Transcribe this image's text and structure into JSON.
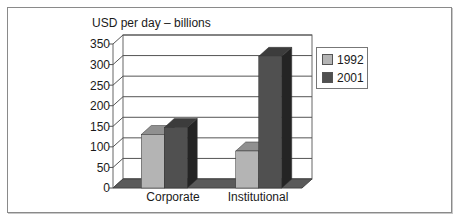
{
  "chart_data": {
    "type": "bar",
    "style": "3d-clustered-column",
    "title": "USD per day –  billions",
    "xlabel": "",
    "ylabel": "USD per day – billions",
    "categories": [
      "Corporate",
      "Institutional"
    ],
    "series": [
      {
        "name": "1992",
        "values": [
          130,
          90
        ],
        "color": "#b4b4b4"
      },
      {
        "name": "2001",
        "values": [
          147,
          320
        ],
        "color": "#505050"
      }
    ],
    "ylim": [
      0,
      350
    ],
    "yticks": [
      "350",
      "300",
      "250",
      "200",
      "150",
      "100",
      "50",
      "0"
    ],
    "grid": true,
    "legend_position": "right"
  },
  "legend": {
    "items": [
      {
        "label": "1992",
        "color": "#b4b4b4"
      },
      {
        "label": "2001",
        "color": "#505050"
      }
    ]
  }
}
